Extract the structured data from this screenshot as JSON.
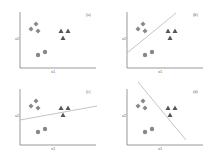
{
  "figure": {
    "axis_x_label": "x1",
    "axis_y_label": "x2",
    "colors": {
      "axis": "#555555",
      "marker": "#888888",
      "triangle": "#555555",
      "line": "#aaaaaa"
    },
    "panels": [
      {
        "id": "a",
        "label": "(a)",
        "line": null
      },
      {
        "id": "b",
        "label": "(b)",
        "line": [
          20,
          53,
          69,
          13
        ]
      },
      {
        "id": "c",
        "label": "(c)",
        "line": [
          20,
          43,
          97,
          29
        ]
      },
      {
        "id": "d",
        "label": "(d)",
        "line": [
          31,
          5,
          79,
          63
        ]
      }
    ],
    "points": {
      "diamonds": [
        [
          36,
          24
        ],
        [
          31,
          29
        ],
        [
          38,
          31
        ]
      ],
      "circles": [
        [
          38,
          55
        ],
        [
          45,
          52
        ]
      ],
      "triangles": [
        [
          61,
          31
        ],
        [
          68,
          31
        ],
        [
          63,
          38
        ]
      ]
    }
  }
}
